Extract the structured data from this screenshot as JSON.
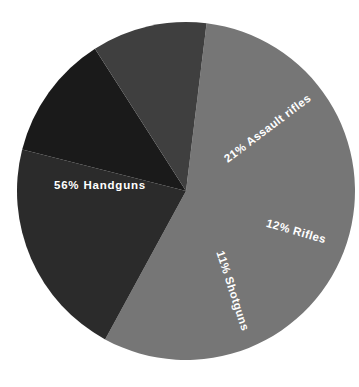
{
  "chart_data": {
    "type": "pie",
    "title": "",
    "subtitle": "",
    "xlabel": "",
    "ylabel": "",
    "legend": "none",
    "grid": false,
    "categories": [
      "Handguns",
      "Assault rifles",
      "Rifles",
      "Shotguns"
    ],
    "values": [
      56,
      21,
      12,
      11
    ],
    "unit": "%",
    "labels": [
      {
        "text": "56%  Handguns",
        "percent": "56%",
        "name": "Handguns",
        "value": 56,
        "color": "#767676",
        "text_color": "#ffffff",
        "x": 100,
        "y": 186,
        "rotation": 0,
        "anchor": "middle"
      },
      {
        "text": "21%  Assault rifles",
        "percent": "21%",
        "name": "Assault rifles",
        "value": 21,
        "color": "#2b2b2b",
        "text_color": "#ffffff",
        "x": 268,
        "y": 129,
        "rotation": -37,
        "anchor": "middle"
      },
      {
        "text": "12%  Rifles",
        "percent": "12%",
        "name": "Rifles",
        "value": 12,
        "color": "#1a1a1a",
        "text_color": "#ffffff",
        "x": 296,
        "y": 232,
        "rotation": 16,
        "anchor": "middle"
      },
      {
        "text": "11%  Shotguns",
        "percent": "11%",
        "name": "Shotguns",
        "value": 11,
        "color": "#3f3f3f",
        "text_color": "#ffffff",
        "x": 232,
        "y": 291,
        "rotation": 72,
        "anchor": "middle"
      }
    ],
    "geometry": {
      "center_x": 186,
      "center_y": 191,
      "radius": 169,
      "start_angle_deg": -83,
      "direction": "clockwise"
    },
    "background_color": "#ffffff"
  }
}
